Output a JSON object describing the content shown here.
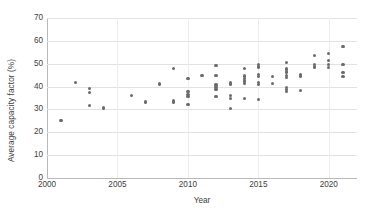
{
  "chart_data": {
    "type": "scatter",
    "title": "",
    "xlabel": "Year",
    "ylabel": "Average capacity factor (%)",
    "xlim": [
      2000,
      2022
    ],
    "ylim": [
      0,
      70
    ],
    "xticks": [
      2000,
      2005,
      2010,
      2015,
      2020
    ],
    "yticks": [
      0,
      10,
      20,
      30,
      40,
      50,
      60,
      70
    ],
    "grid": "horizontal",
    "legend": "none",
    "marker_color": "#6b6b6b",
    "series": [
      {
        "name": "Average capacity factor",
        "points": [
          [
            2001,
            25.3
          ],
          [
            2002,
            41.8
          ],
          [
            2003,
            39.0
          ],
          [
            2003,
            37.4
          ],
          [
            2003,
            31.7
          ],
          [
            2004,
            30.6
          ],
          [
            2006,
            36.0
          ],
          [
            2007,
            33.6
          ],
          [
            2007,
            33.1
          ],
          [
            2008,
            41.1
          ],
          [
            2009,
            47.9
          ],
          [
            2009,
            33.7
          ],
          [
            2009,
            33.0
          ],
          [
            2010,
            43.6
          ],
          [
            2010,
            37.7
          ],
          [
            2010,
            36.4
          ],
          [
            2010,
            35.6
          ],
          [
            2010,
            32.2
          ],
          [
            2011,
            44.7
          ],
          [
            2012,
            49.2
          ],
          [
            2012,
            44.8
          ],
          [
            2012,
            40.7
          ],
          [
            2012,
            39.6
          ],
          [
            2012,
            38.6
          ],
          [
            2012,
            35.6
          ],
          [
            2013,
            41.6
          ],
          [
            2013,
            40.8
          ],
          [
            2013,
            36.0
          ],
          [
            2013,
            34.9
          ],
          [
            2013,
            30.5
          ],
          [
            2014,
            47.9
          ],
          [
            2014,
            44.6
          ],
          [
            2014,
            43.4
          ],
          [
            2014,
            42.4
          ],
          [
            2014,
            41.3
          ],
          [
            2014,
            34.9
          ],
          [
            2015,
            49.6
          ],
          [
            2015,
            48.6
          ],
          [
            2015,
            45.4
          ],
          [
            2015,
            44.4
          ],
          [
            2015,
            41.7
          ],
          [
            2015,
            40.8
          ],
          [
            2015,
            34.3
          ],
          [
            2016,
            44.3
          ],
          [
            2016,
            41.4
          ],
          [
            2017,
            50.5
          ],
          [
            2017,
            47.7
          ],
          [
            2017,
            46.4
          ],
          [
            2017,
            44.9
          ],
          [
            2017,
            43.9
          ],
          [
            2017,
            39.6
          ],
          [
            2017,
            38.7
          ],
          [
            2017,
            37.8
          ],
          [
            2018,
            45.4
          ],
          [
            2018,
            44.6
          ],
          [
            2018,
            38.2
          ],
          [
            2019,
            53.6
          ],
          [
            2019,
            49.5
          ],
          [
            2019,
            48.8
          ],
          [
            2019,
            48.2
          ],
          [
            2020,
            54.6
          ],
          [
            2020,
            51.3
          ],
          [
            2020,
            49.6
          ],
          [
            2020,
            48.5
          ],
          [
            2021,
            57.4
          ],
          [
            2021,
            49.5
          ],
          [
            2021,
            46.3
          ],
          [
            2021,
            44.4
          ]
        ]
      }
    ]
  }
}
